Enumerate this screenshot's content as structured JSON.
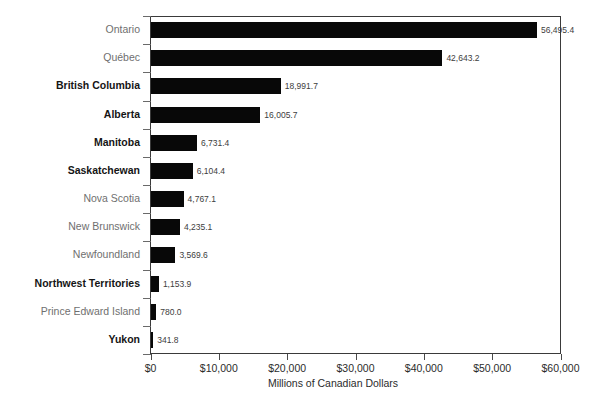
{
  "chart_data": {
    "type": "bar",
    "orientation": "horizontal",
    "title": "",
    "xlabel": "Millions of Canadian Dollars",
    "ylabel": "",
    "xlim": [
      0,
      60000
    ],
    "xticks": [
      0,
      10000,
      20000,
      30000,
      40000,
      50000,
      60000
    ],
    "xtick_labels": [
      "$0",
      "$10,000",
      "$20,000",
      "$30,000",
      "$40,000",
      "$50,000",
      "$60,000"
    ],
    "grid": false,
    "legend": null,
    "bar_color": "#080808",
    "categories": [
      "Ontario",
      "Québec",
      "British Columbia",
      "Alberta",
      "Manitoba",
      "Saskatchewan",
      "Nova Scotia",
      "New Brunswick",
      "Newfoundland",
      "Northwest Territories",
      "Prince Edward Island",
      "Yukon"
    ],
    "values": [
      56495.4,
      42643.2,
      18991.7,
      16005.7,
      6731.4,
      6104.4,
      4767.1,
      4235.1,
      3569.6,
      1153.9,
      780.0,
      341.8
    ],
    "value_labels": [
      "56,495.4",
      "42,643.2",
      "18,991.7",
      "16,005.7",
      "6,731.4",
      "6,104.4",
      "4,767.1",
      "4,235.1",
      "3,569.6",
      "1,153.9",
      "780.0",
      "341.8"
    ],
    "category_emphasis": [
      false,
      false,
      true,
      true,
      true,
      true,
      false,
      false,
      false,
      true,
      false,
      true
    ]
  }
}
